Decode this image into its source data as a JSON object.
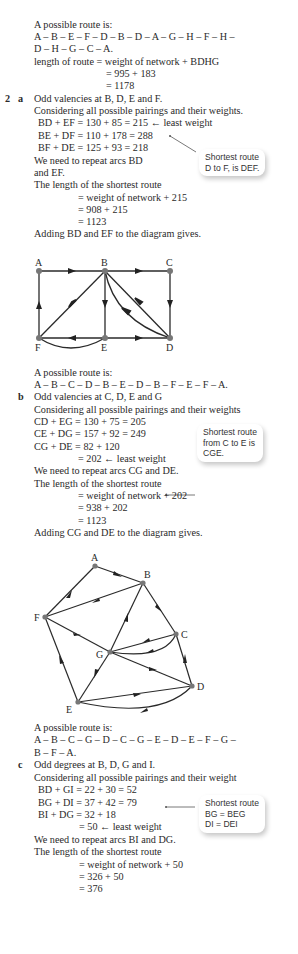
{
  "part_1_end": {
    "route_intro": "A possible route is:",
    "route_line1": "A – B – E – F – D – B – D – A – G – H – F – H –",
    "route_line2": "D – H – G – C – A.",
    "length_line": "length of route = weight of network + BDHG",
    "calc1": "= 995 + 183",
    "calc2": "= 1178"
  },
  "q2": {
    "number": "2",
    "a": {
      "letter": "a",
      "lines": [
        "Odd valencies at B, D, E and F.",
        "Considering all possible pairings and their weights.",
        "BD + EF = 130 + 85 = 215 ← least weight",
        "BE + DF = 110 + 178 = 288",
        "BF + DE = 125 + 93 = 218",
        "We need to repeat arcs BD",
        "and EF.",
        "The length of the shortest route",
        "= weight of network + 215",
        "= 908 + 215",
        "= 1123",
        "Adding BD and EF to the diagram gives."
      ],
      "callout": [
        "Shortest route",
        "D to F, is DEF."
      ],
      "diagram_labels": {
        "A": "A",
        "B": "B",
        "C": "C",
        "D": "D",
        "E": "E",
        "F": "F"
      },
      "route_intro": "A possible route is:",
      "route": "A – B – C – D – B – E – D – B – F – E – F – A."
    },
    "b": {
      "letter": "b",
      "lines": [
        "Odd valencies at C, D, E and G",
        "Considering all possible pairings and their weights",
        "CD + EG = 130 + 75 = 205",
        "CE + DG = 157 + 92 = 249",
        "CG + DE = 82 + 120",
        "= 202 ← least weight",
        "We need to repeat arcs CG and DE.",
        "The length of the shortest route",
        "= weight of network + 202",
        "= 938 + 202",
        "= 1123",
        "Adding CG and DE to the diagram gives."
      ],
      "callout": [
        "Shortest route",
        "from C to E is",
        "CGE."
      ],
      "diagram_labels": {
        "A": "A",
        "B": "B",
        "C": "C",
        "D": "D",
        "E": "E",
        "F": "F",
        "G": "G"
      },
      "route_intro": "A possible route is:",
      "route_line1": "A – B – C – G – D – C – G – E – D – E – F – G –",
      "route_line2": "B – F – A."
    },
    "c": {
      "letter": "c",
      "lines": [
        "Odd degrees at B, D, G and I.",
        "Considering all possible pairings and their weight",
        "BD + GI = 22 + 30 = 52",
        "BG + DI = 37 + 42 = 79",
        "BI + DG = 32 + 18",
        "= 50 ← least weight",
        "We need to repeat arcs BI and DG.",
        "The length of the shortest route",
        "= weight of network + 50",
        "= 326 + 50",
        "= 376"
      ],
      "callout": [
        "Shortest route",
        "BG = BEG",
        "DI = DEI"
      ]
    }
  }
}
